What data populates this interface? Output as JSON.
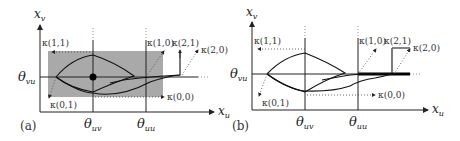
{
  "panels": [
    {
      "id": "a",
      "label": "(a)",
      "y_axis_label": "x",
      "y_axis_sub": "v",
      "x_axis_label": "x",
      "x_axis_sub": "u",
      "y_threshold": "θ",
      "y_threshold_sub": "vu",
      "x_threshold_1": "θ",
      "x_threshold_1_sub": "uv",
      "x_threshold_2": "θ",
      "x_threshold_2_sub": "uu",
      "kappa_labels": [
        "κ(1,1)",
        "κ(1,0)",
        "κ(2,1)",
        "κ(2,0)",
        "κ(0,1)",
        "κ(0,0)"
      ],
      "shaded_region": true,
      "fixed_point": "filled-dot"
    },
    {
      "id": "b",
      "label": "(b)",
      "y_axis_label": "x",
      "y_axis_sub": "v",
      "x_axis_label": "x",
      "x_axis_sub": "u",
      "y_threshold": "θ",
      "y_threshold_sub": "vu",
      "x_threshold_1": "θ",
      "x_threshold_1_sub": "uv",
      "x_threshold_2": "θ",
      "x_threshold_2_sub": "uu",
      "kappa_labels": [
        "κ(1,1)",
        "κ(1,0)",
        "κ(2,1)",
        "κ(2,0)",
        "κ(0,1)",
        "κ(0,0)"
      ],
      "shaded_region": false,
      "sliding_segment": "thick-line"
    }
  ],
  "colors": {
    "shade": "#a9a9a9",
    "line": "#1a1a1a"
  }
}
